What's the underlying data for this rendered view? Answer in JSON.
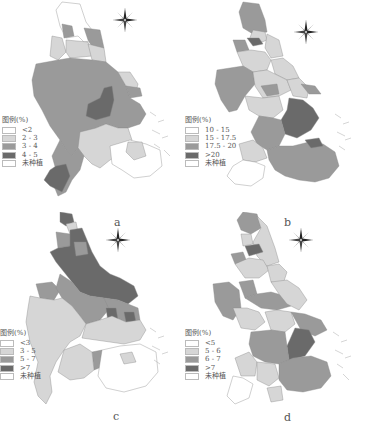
{
  "figure": {
    "panels": [
      {
        "id": "a",
        "position": "top-left",
        "legend": {
          "title": "图例(%)",
          "items": [
            {
              "label": "<2",
              "color": "#ffffff"
            },
            {
              "label": "2 - 3",
              "color": "#d6d6d6"
            },
            {
              "label": "3 - 4",
              "color": "#9a9a9a"
            },
            {
              "label": "4 - 5",
              "color": "#6a6a6a"
            },
            {
              "label": "未种植",
              "color": "#ffffff"
            }
          ]
        }
      },
      {
        "id": "b",
        "position": "top-right",
        "legend": {
          "title": "图例(%)",
          "items": [
            {
              "label": "10 - 15",
              "color": "#ffffff"
            },
            {
              "label": "15 - 17.5",
              "color": "#d6d6d6"
            },
            {
              "label": "17.5 - 20",
              "color": "#9a9a9a"
            },
            {
              "label": ">20",
              "color": "#6a6a6a"
            },
            {
              "label": "未种植",
              "color": "#ffffff"
            }
          ]
        }
      },
      {
        "id": "c",
        "position": "bottom-left",
        "legend": {
          "title": "图例(%)",
          "items": [
            {
              "label": "<3",
              "color": "#ffffff"
            },
            {
              "label": "3 - 5",
              "color": "#d6d6d6"
            },
            {
              "label": "5 - 7",
              "color": "#9a9a9a"
            },
            {
              "label": ">7",
              "color": "#6a6a6a"
            },
            {
              "label": "未种植",
              "color": "#ffffff"
            }
          ]
        }
      },
      {
        "id": "d",
        "position": "bottom-right",
        "legend": {
          "title": "图例(%)",
          "items": [
            {
              "label": "<5",
              "color": "#ffffff"
            },
            {
              "label": "5 - 6",
              "color": "#d6d6d6"
            },
            {
              "label": "6 - 7",
              "color": "#9a9a9a"
            },
            {
              "label": ">7",
              "color": "#6a6a6a"
            },
            {
              "label": "未种植",
              "color": "#ffffff"
            }
          ]
        }
      }
    ],
    "labels": {
      "a": "a",
      "b": "b",
      "c": "c",
      "d": "d"
    },
    "compass": {
      "north": "N"
    }
  }
}
